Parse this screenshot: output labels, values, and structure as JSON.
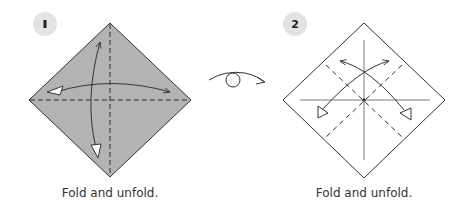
{
  "steps": [
    {
      "number": "1",
      "badge_glyph": "▮",
      "caption": "Fold and unfold.",
      "paper": "colored side up",
      "folds": [
        "vertical valley fold and unfold",
        "horizontal valley fold and unfold"
      ]
    },
    {
      "number": "2",
      "badge_glyph": "2",
      "caption": "Fold and unfold.",
      "paper": "white side up",
      "folds": [
        "diagonal valley fold and unfold",
        "diagonal valley fold and unfold"
      ]
    }
  ],
  "transition_symbol": "turn-over",
  "colors": {
    "paper_colored": "#b3b3b3",
    "paper_white": "#ffffff",
    "line": "#333333",
    "badge_bg": "#e3e3e3",
    "badge_text": "#222222"
  }
}
